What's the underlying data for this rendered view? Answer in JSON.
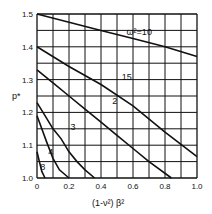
{
  "chart_data": {
    "type": "line",
    "title": "",
    "xlabel": "(1-ν²) β²",
    "ylabel": "p*",
    "xlim": [
      0,
      1.0
    ],
    "ylim": [
      1.0,
      1.5
    ],
    "grid": true,
    "x_ticks": [
      "0",
      "0.2",
      "0.4",
      "0.6",
      "0.8",
      "1.0"
    ],
    "y_ticks": [
      "1.0",
      "1.1",
      "1.2",
      "1.3",
      "1.4",
      "1.5"
    ],
    "series": [
      {
        "name": "ω²=10",
        "label": "ω²=10",
        "x": [
          0,
          0.2,
          0.4,
          0.6,
          0.8,
          1.0
        ],
        "y": [
          1.5,
          1.475,
          1.45,
          1.425,
          1.4,
          1.37
        ]
      },
      {
        "name": "15",
        "label": "15",
        "x": [
          0,
          0.2,
          0.4,
          0.6,
          0.8,
          1.0
        ],
        "y": [
          1.4,
          1.34,
          1.285,
          1.22,
          1.14,
          1.065
        ]
      },
      {
        "name": "2",
        "label": "2",
        "x": [
          0,
          0.1,
          0.2,
          0.3,
          0.4,
          0.5,
          0.6,
          0.7,
          0.84
        ],
        "y": [
          1.33,
          1.29,
          1.25,
          1.21,
          1.17,
          1.13,
          1.09,
          1.05,
          1.0
        ]
      },
      {
        "name": "3",
        "label": "3",
        "x": [
          0,
          0.05,
          0.1,
          0.15,
          0.2,
          0.25,
          0.3,
          0.36
        ],
        "y": [
          1.23,
          1.19,
          1.15,
          1.12,
          1.08,
          1.05,
          1.025,
          1.0
        ]
      },
      {
        "name": "4",
        "label": "4",
        "x": [
          0,
          0.03,
          0.06,
          0.1,
          0.14,
          0.2
        ],
        "y": [
          1.19,
          1.15,
          1.11,
          1.06,
          1.025,
          1.0
        ]
      },
      {
        "name": "8",
        "label": "8",
        "x": [
          0,
          0.015,
          0.03,
          0.05
        ],
        "y": [
          1.08,
          1.05,
          1.02,
          1.0
        ]
      }
    ]
  }
}
